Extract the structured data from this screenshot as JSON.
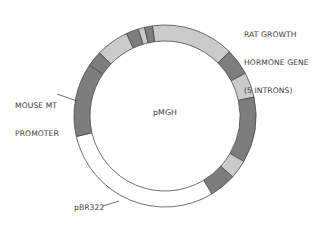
{
  "diagram": {
    "title": "pMGH",
    "type": "plasmid-map",
    "center": {
      "x": 165,
      "y": 116
    },
    "outer_radius": 91,
    "inner_radius": 75,
    "colors": {
      "dark": "#7d7d7d",
      "light": "#cbcbcb",
      "white": "#ffffff",
      "stroke": "#4a4a4a",
      "text": "#3a3a3a"
    },
    "segments": [
      {
        "start": -8,
        "end": 45,
        "fill": "light",
        "region": "rat-gh-gene"
      },
      {
        "start": 45,
        "end": 62,
        "fill": "dark",
        "region": "rat-gh-gene"
      },
      {
        "start": 62,
        "end": 78,
        "fill": "light",
        "region": "rat-gh-gene"
      },
      {
        "start": 78,
        "end": 120,
        "fill": "dark",
        "region": "rat-gh-gene"
      },
      {
        "start": 120,
        "end": 132,
        "fill": "light",
        "region": "rat-gh-gene"
      },
      {
        "start": 132,
        "end": 149,
        "fill": "dark",
        "region": "rat-gh-gene"
      },
      {
        "start": 149,
        "end": 257,
        "fill": "white",
        "region": "pbr322"
      },
      {
        "start": 257,
        "end": 304,
        "fill": "dark",
        "region": "mouse-mt-promoter"
      },
      {
        "start": 304,
        "end": 314,
        "fill": "dark",
        "region": "rat-gh-gene"
      },
      {
        "start": 314,
        "end": 335,
        "fill": "light",
        "region": "rat-gh-gene"
      },
      {
        "start": 335,
        "end": 343,
        "fill": "dark",
        "region": "rat-gh-gene"
      },
      {
        "start": 343,
        "end": 347,
        "fill": "light",
        "region": "rat-gh-gene"
      },
      {
        "start": 347,
        "end": 352,
        "fill": "dark",
        "region": "rat-gh-gene"
      }
    ],
    "labels": {
      "rat_gene": [
        "RAT GROWTH",
        "HORMONE GENE",
        "(5 INTRONS)"
      ],
      "mouse_promoter": [
        "MOUSE MT",
        "PROMOTER"
      ],
      "pbr322": "pBR322",
      "center": "pMGH"
    },
    "leaders": [
      {
        "name": "mouse-promoter-leader",
        "x1": 57,
        "y1": 94,
        "x2": 77,
        "y2": 101
      },
      {
        "name": "pbr322-leader",
        "x1": 103,
        "y1": 206,
        "x2": 119,
        "y2": 201
      }
    ]
  }
}
